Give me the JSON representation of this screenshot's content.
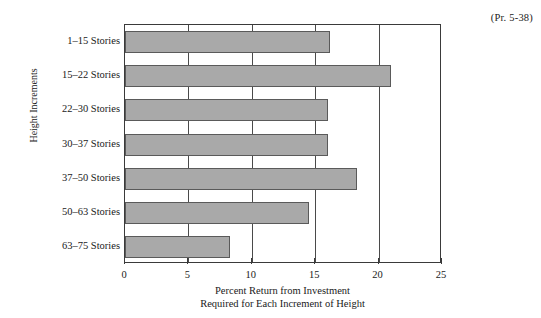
{
  "annotation": "(Pr. 5-38)",
  "chart_data": {
    "type": "bar",
    "orientation": "horizontal",
    "title": "",
    "xlabel_line1": "Percent Return from Investment",
    "xlabel_line2": "Required for Each Increment of Height",
    "ylabel": "Height Increments",
    "categories": [
      "1–15 Stories",
      "15–22 Stories",
      "22–30 Stories",
      "30–37 Stories",
      "37–50 Stories",
      "50–63 Stories",
      "63–75 Stories"
    ],
    "values": [
      16.2,
      21.0,
      16.0,
      16.0,
      18.3,
      14.5,
      8.3
    ],
    "xlim": [
      0,
      25
    ],
    "xticks": [
      0,
      5,
      10,
      15,
      20,
      25
    ],
    "xticklabels": [
      "0",
      "5",
      "10",
      "15",
      "20",
      "25"
    ],
    "grid": "vertical-only",
    "legend": "none",
    "bar_color": "#a9a9a9",
    "bar_edge_color": "#5a5a5a",
    "axis_color": "#3a3a3a"
  }
}
